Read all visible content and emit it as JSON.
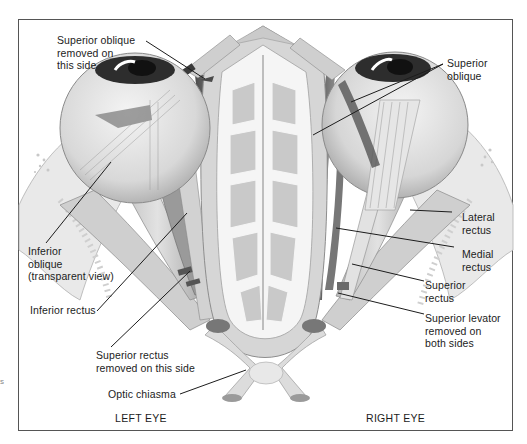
{
  "figure": {
    "captions": {
      "left": "LEFT EYE",
      "right": "RIGHT EYE"
    },
    "labels": [
      {
        "id": "superior-oblique-removed",
        "text": "Superior oblique\nremoved on\nthis side"
      },
      {
        "id": "superior-oblique",
        "text": "Superior\noblique"
      },
      {
        "id": "inferior-oblique",
        "text": "Inferior\noblique\n(transparent view)"
      },
      {
        "id": "lateral-rectus",
        "text": "Lateral\nrectus"
      },
      {
        "id": "medial-rectus",
        "text": "Medial\nrectus"
      },
      {
        "id": "inferior-rectus",
        "text": "Inferior rectus"
      },
      {
        "id": "superior-rectus",
        "text": "Superior\nrectus"
      },
      {
        "id": "superior-levator",
        "text": "Superior levator\nremoved on\nboth sides"
      },
      {
        "id": "superior-rectus-removed",
        "text": "Superior rectus\nremoved on this side"
      },
      {
        "id": "optic-chiasma",
        "text": "Optic chiasma"
      }
    ],
    "stray_mark": "s",
    "colors": {
      "frame": "#555555",
      "ink": "#1c1c1c",
      "tissue_light": "#e4e4e4",
      "tissue_mid": "#c4c4c4",
      "tissue_dark": "#6a6a6a",
      "bone_cell": "#bdbdbd"
    }
  }
}
